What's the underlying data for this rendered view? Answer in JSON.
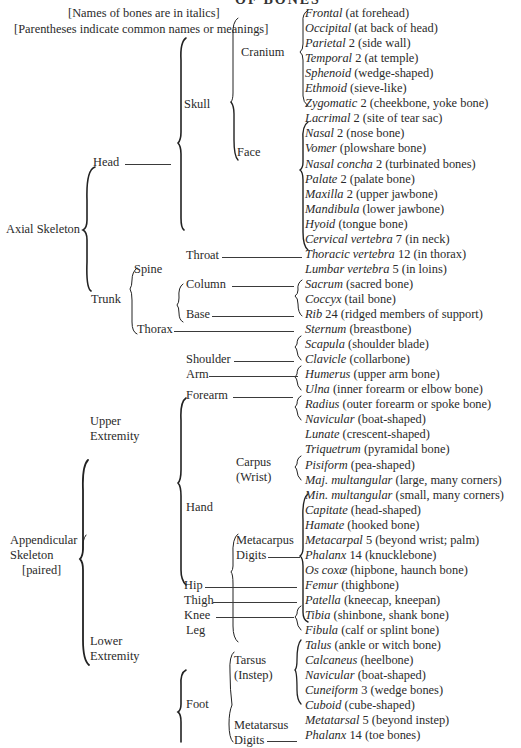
{
  "title": "OF BONES",
  "notes": [
    "[Names of bones are in italics]",
    "[Parentheses indicate common names or meanings]"
  ],
  "divisions": {
    "axial": "Axial Skeleton",
    "appendicular": [
      "Appendicular",
      "Skeleton",
      "[paired]"
    ]
  },
  "regions": {
    "head": "Head",
    "trunk": "Trunk",
    "upper": [
      "Upper",
      "Extremity"
    ],
    "lower": [
      "Lower",
      "Extremity"
    ],
    "skull": "Skull",
    "throat": "Throat",
    "spine": "Spine",
    "thorax": "Thorax",
    "cranium": "Cranium",
    "face": "Face",
    "column": "Column",
    "base": "Base",
    "shoulder": "Shoulder",
    "arm": "Arm",
    "forearm": "Forearm",
    "hand": "Hand",
    "carpus": [
      "Carpus",
      "(Wrist)"
    ],
    "metacarpus": "Metacarpus",
    "digits_hand": "Digits",
    "hip": "Hip",
    "thigh": "Thigh",
    "knee": "Knee",
    "leg": "Leg",
    "foot": "Foot",
    "tarsus": [
      "Tarsus",
      "(Instep)"
    ],
    "metatarsus": "Metatarsus",
    "digits_foot": "Digits"
  },
  "bones": [
    {
      "name": "Frontal",
      "count": "",
      "meaning": "(at forehead)"
    },
    {
      "name": "Occipital",
      "count": "",
      "meaning": "(at back of head)"
    },
    {
      "name": "Parietal",
      "count": "2",
      "meaning": "(side wall)"
    },
    {
      "name": "Temporal",
      "count": "2",
      "meaning": "(at temple)"
    },
    {
      "name": "Sphenoid",
      "count": "",
      "meaning": "(wedge-shaped)"
    },
    {
      "name": "Ethmoid",
      "count": "",
      "meaning": "(sieve-like)"
    },
    {
      "name": "Zygomatic",
      "count": "2",
      "meaning": "(cheekbone, yoke bone)"
    },
    {
      "name": "Lacrimal",
      "count": "2",
      "meaning": "(site of tear sac)"
    },
    {
      "name": "Nasal",
      "count": "2",
      "meaning": "(nose bone)"
    },
    {
      "name": "Vomer",
      "count": "",
      "meaning": "(plowshare bone)"
    },
    {
      "name": "Nasal concha",
      "count": "2",
      "meaning": "(turbinated bones)"
    },
    {
      "name": "Palate",
      "count": "2",
      "meaning": "(palate bone)"
    },
    {
      "name": "Maxilla",
      "count": "2",
      "meaning": "(upper jawbone)"
    },
    {
      "name": "Mandibula",
      "count": "",
      "meaning": "(lower jawbone)"
    },
    {
      "name": "Hyoid",
      "count": "",
      "meaning": "(tongue bone)"
    },
    {
      "name": "Cervical vertebra",
      "count": "7",
      "meaning": "(in neck)"
    },
    {
      "name": "Thoracic vertebra",
      "count": "12",
      "meaning": "(in thorax)"
    },
    {
      "name": "Lumbar vertebra",
      "count": "5",
      "meaning": "(in loins)"
    },
    {
      "name": "Sacrum",
      "count": "",
      "meaning": "(sacred bone)"
    },
    {
      "name": "Coccyx",
      "count": "",
      "meaning": "(tail bone)"
    },
    {
      "name": "Rib",
      "count": "24",
      "meaning": "(ridged members of support)"
    },
    {
      "name": "Sternum",
      "count": "",
      "meaning": "(breastbone)"
    },
    {
      "name": "Scapula",
      "count": "",
      "meaning": "(shoulder blade)"
    },
    {
      "name": "Clavicle",
      "count": "",
      "meaning": "(collarbone)"
    },
    {
      "name": "Humerus",
      "count": "",
      "meaning": "(upper arm bone)"
    },
    {
      "name": "Ulna",
      "count": "",
      "meaning": "(inner forearm or elbow bone)"
    },
    {
      "name": "Radius",
      "count": "",
      "meaning": "(outer forearm or spoke bone)"
    },
    {
      "name": "Navicular",
      "count": "",
      "meaning": "(boat-shaped)"
    },
    {
      "name": "Lunate",
      "count": "",
      "meaning": "(crescent-shaped)"
    },
    {
      "name": "Triquetrum",
      "count": "",
      "meaning": "(pyramidal bone)"
    },
    {
      "name": "Pisiform",
      "count": "",
      "meaning": "(pea-shaped)"
    },
    {
      "name": "Maj. multangular",
      "count": "",
      "meaning": "(large, many corners)"
    },
    {
      "name": "Min. multangular",
      "count": "",
      "meaning": "(small, many corners)"
    },
    {
      "name": "Capitate",
      "count": "",
      "meaning": "(head-shaped)"
    },
    {
      "name": "Hamate",
      "count": "",
      "meaning": "(hooked bone)"
    },
    {
      "name": "Metacarpal",
      "count": "5",
      "meaning": "(beyond wrist; palm)"
    },
    {
      "name": "Phalanx",
      "count": "14",
      "meaning": "(knucklebone)"
    },
    {
      "name": "Os coxæ",
      "count": "",
      "meaning": "(hipbone, haunch bone)"
    },
    {
      "name": "Femur",
      "count": "",
      "meaning": "(thighbone)"
    },
    {
      "name": "Patella",
      "count": "",
      "meaning": "(kneecap, kneepan)"
    },
    {
      "name": "Tibia",
      "count": "",
      "meaning": "(shinbone, shank bone)"
    },
    {
      "name": "Fibula",
      "count": "",
      "meaning": "(calf or splint bone)"
    },
    {
      "name": "Talus",
      "count": "",
      "meaning": "(ankle or witch bone)"
    },
    {
      "name": "Calcaneus",
      "count": "",
      "meaning": "(heelbone)"
    },
    {
      "name": "Navicular",
      "count": "",
      "meaning": "(boat-shaped)"
    },
    {
      "name": "Cuneiform",
      "count": "3",
      "meaning": "(wedge bones)"
    },
    {
      "name": "Cuboid",
      "count": "",
      "meaning": "(cube-shaped)"
    },
    {
      "name": "Metatarsal",
      "count": "5",
      "meaning": "(beyond instep)"
    },
    {
      "name": "Phalanx",
      "count": "14",
      "meaning": "(toe bones)"
    }
  ]
}
